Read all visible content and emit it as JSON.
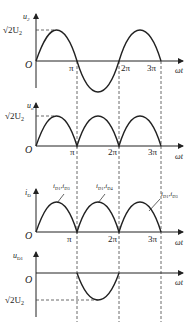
{
  "panels": [
    {
      "id": "u2",
      "ylabel": "u",
      "ysub": "2",
      "peak_label": "√2U",
      "peak_sub": "2",
      "origin": "O",
      "waveform": "full-sine"
    },
    {
      "id": "uo",
      "ylabel": "u",
      "ysub": "o",
      "peak_label": "√2U",
      "peak_sub": "2",
      "origin": "O",
      "waveform": "full-wave-rectified"
    },
    {
      "id": "iD",
      "ylabel": "i",
      "ysub": "D",
      "origin": "O",
      "waveform": "full-wave-rectified",
      "annotations": [
        {
          "main": "i",
          "sub1": "D1",
          "sep": ",",
          "main2": "i",
          "sub2": "D3"
        },
        {
          "main": "i",
          "sub1": "D1",
          "sep": ",",
          "main2": "i",
          "sub2": "D4"
        },
        {
          "main": "i",
          "sub1": "D1",
          "sep": ",",
          "main2": "i",
          "sub2": "D3"
        }
      ]
    },
    {
      "id": "uD1",
      "ylabel": "u",
      "ysub": "D1",
      "peak_label": "√2U",
      "peak_sub": "2",
      "origin": "O",
      "waveform": "negative-half-sine"
    }
  ],
  "x_ticks": [
    "π",
    "2π",
    "3π"
  ],
  "x_axis_label": "ωt",
  "colors": {
    "line": "#222222",
    "dash": "#444444"
  }
}
